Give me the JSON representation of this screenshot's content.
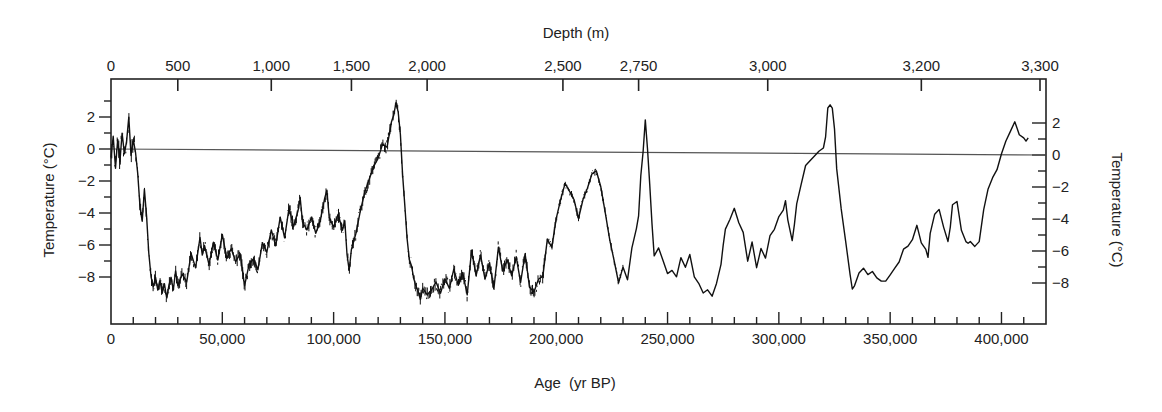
{
  "chart_data": {
    "type": "line",
    "title": "",
    "xlabel": "Age (yr BP)",
    "xlabel_main": "Age",
    "xlabel_unit": "(yr BP)",
    "x2label": "Depth (m)",
    "ylabel": "Temperature (°C)",
    "y2label": "Temperature (°C)",
    "xlim": [
      0,
      420000
    ],
    "ylim": [
      -10.8,
      4.6
    ],
    "grid": false,
    "legend": null,
    "reference_line": {
      "y": 0,
      "label": ""
    },
    "x_ticks": [
      0,
      50000,
      100000,
      150000,
      200000,
      250000,
      300000,
      350000,
      400000
    ],
    "x_tick_labels": [
      "0",
      "50,000",
      "100,000",
      "150,000",
      "200,000",
      "250,000",
      "300,000",
      "350,000",
      "400,000"
    ],
    "x_minor_tick_step": 10000,
    "top_depth_ticks": [
      {
        "label": "0",
        "age": 0
      },
      {
        "label": "500",
        "age": 30000
      },
      {
        "label": "1,000",
        "age": 72000
      },
      {
        "label": "1,500",
        "age": 108000
      },
      {
        "label": "2,000",
        "age": 142000
      },
      {
        "label": "2,500",
        "age": 203000
      },
      {
        "label": "2,750",
        "age": 237000
      },
      {
        "label": "3,000",
        "age": 295000
      },
      {
        "label": "3,200",
        "age": 364000
      },
      {
        "label": "3,300",
        "age": 420000
      }
    ],
    "y_ticks": [
      2,
      0,
      -2,
      -4,
      -6,
      -8
    ],
    "y_tick_labels": [
      "2",
      "0",
      "−2",
      "−4",
      "−6",
      "−8"
    ],
    "series": [
      {
        "name": "Temperature anomaly",
        "x_kyr": [
          0,
          1,
          2,
          3,
          4,
          5,
          6,
          7,
          8,
          9,
          10,
          11,
          12,
          13,
          14,
          15,
          16,
          17,
          18,
          19,
          20,
          21,
          22,
          23,
          24,
          25,
          26,
          27,
          28,
          29,
          30,
          32,
          34,
          36,
          38,
          40,
          41,
          42,
          44,
          46,
          48,
          50,
          52,
          54,
          56,
          58,
          60,
          62,
          64,
          66,
          68,
          70,
          72,
          74,
          76,
          78,
          80,
          82,
          84,
          85,
          86,
          88,
          90,
          92,
          94,
          96,
          97,
          98,
          100,
          102,
          104,
          105,
          106,
          107,
          108,
          110,
          112,
          114,
          116,
          118,
          120,
          122,
          124,
          126,
          127,
          128,
          129,
          130,
          131,
          132,
          133,
          134,
          135,
          136,
          137,
          138,
          139,
          140,
          142,
          144,
          146,
          148,
          150,
          152,
          154,
          156,
          158,
          160,
          162,
          164,
          166,
          168,
          170,
          172,
          174,
          176,
          178,
          180,
          182,
          184,
          186,
          188,
          190,
          192,
          194,
          196,
          198,
          200,
          202,
          204,
          206,
          208,
          210,
          212,
          214,
          216,
          218,
          220,
          222,
          224,
          226,
          228,
          230,
          232,
          234,
          236,
          237,
          238,
          239,
          240,
          241,
          242,
          243,
          244,
          246,
          248,
          250,
          252,
          254,
          256,
          258,
          260,
          262,
          264,
          266,
          268,
          270,
          272,
          274,
          275,
          276,
          278,
          280,
          282,
          284,
          286,
          288,
          290,
          292,
          294,
          296,
          298,
          300,
          302,
          303,
          304,
          306,
          307,
          308,
          310,
          312,
          314,
          316,
          318,
          320,
          321,
          322,
          323,
          324,
          325,
          326,
          328,
          330,
          332,
          333,
          334,
          336,
          338,
          340,
          342,
          344,
          346,
          348,
          350,
          352,
          354,
          356,
          358,
          360,
          362,
          364,
          366,
          367,
          368,
          370,
          372,
          374,
          376,
          377,
          378,
          380,
          382,
          384,
          385,
          386,
          388,
          390,
          392,
          394,
          396,
          398,
          400,
          402,
          404,
          406,
          408,
          410,
          411,
          412,
          413,
          414
        ],
        "temp_c": [
          -0.5,
          0.8,
          -1.2,
          0.6,
          -0.8,
          1.0,
          -0.3,
          0.5,
          2.0,
          -0.4,
          0.6,
          -0.2,
          -1.5,
          -3.5,
          -4.5,
          -2.5,
          -4.2,
          -6.5,
          -8.0,
          -8.6,
          -8.0,
          -8.8,
          -8.2,
          -9.0,
          -8.4,
          -9.3,
          -8.5,
          -8.0,
          -8.8,
          -7.6,
          -8.5,
          -7.8,
          -8.3,
          -6.5,
          -7.4,
          -5.5,
          -6.6,
          -6.0,
          -7.2,
          -5.8,
          -6.9,
          -5.3,
          -6.8,
          -6.2,
          -7.0,
          -6.5,
          -8.5,
          -7.2,
          -6.8,
          -7.5,
          -5.8,
          -6.4,
          -5.0,
          -6.0,
          -4.2,
          -5.5,
          -3.6,
          -4.8,
          -3.8,
          -3.0,
          -4.5,
          -5.0,
          -4.2,
          -5.2,
          -4.4,
          -3.0,
          -2.5,
          -4.2,
          -4.8,
          -4.0,
          -5.0,
          -4.4,
          -6.5,
          -7.5,
          -6.2,
          -5.2,
          -3.8,
          -2.6,
          -1.8,
          -1.0,
          -0.5,
          0.4,
          0.2,
          1.8,
          2.2,
          3.0,
          2.4,
          1.0,
          -1.5,
          -3.5,
          -5.5,
          -6.8,
          -7.2,
          -8.0,
          -8.5,
          -8.8,
          -9.3,
          -8.6,
          -9.0,
          -8.7,
          -8.2,
          -8.9,
          -8.0,
          -8.6,
          -7.4,
          -8.4,
          -7.6,
          -9.0,
          -6.2,
          -7.8,
          -6.5,
          -8.0,
          -7.0,
          -8.6,
          -6.0,
          -7.5,
          -6.8,
          -7.8,
          -6.6,
          -8.2,
          -6.4,
          -8.5,
          -8.8,
          -8.0,
          -7.8,
          -5.5,
          -6.0,
          -4.2,
          -3.0,
          -2.0,
          -2.5,
          -3.0,
          -4.2,
          -3.0,
          -2.3,
          -1.4,
          -1.2,
          -2.2,
          -3.8,
          -5.5,
          -6.8,
          -8.2,
          -7.2,
          -8.0,
          -6.0,
          -4.8,
          -4.0,
          -1.5,
          0.0,
          2.0,
          0.2,
          -2.0,
          -4.5,
          -6.5,
          -6.0,
          -6.8,
          -7.6,
          -7.4,
          -7.8,
          -6.6,
          -7.2,
          -6.4,
          -7.8,
          -8.2,
          -8.8,
          -8.6,
          -9.0,
          -8.2,
          -7.0,
          -5.8,
          -4.8,
          -4.2,
          -3.5,
          -4.4,
          -5.0,
          -6.8,
          -5.6,
          -7.2,
          -6.0,
          -6.6,
          -5.2,
          -4.8,
          -4.0,
          -3.6,
          -3.0,
          -4.2,
          -5.5,
          -4.5,
          -3.2,
          -2.0,
          -0.8,
          -0.5,
          -0.2,
          0.1,
          0.3,
          1.0,
          2.8,
          3.0,
          2.8,
          1.5,
          -1.0,
          -3.5,
          -5.5,
          -7.6,
          -8.5,
          -8.3,
          -7.5,
          -7.2,
          -7.6,
          -7.4,
          -7.8,
          -8.0,
          -8.0,
          -7.6,
          -7.2,
          -6.8,
          -6.0,
          -5.8,
          -5.4,
          -4.5,
          -5.6,
          -6.0,
          -6.5,
          -5.0,
          -3.8,
          -3.5,
          -4.6,
          -5.5,
          -4.6,
          -3.2,
          -3.0,
          -4.8,
          -5.5,
          -5.6,
          -5.5,
          -5.8,
          -5.5,
          -3.5,
          -2.2,
          -1.5,
          -1.0,
          0.0,
          0.8,
          1.4,
          2.0,
          1.2,
          1.0,
          0.8,
          1.0
        ]
      }
    ]
  }
}
